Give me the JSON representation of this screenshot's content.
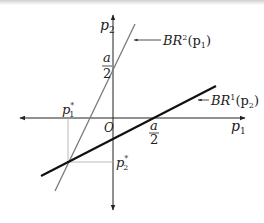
{
  "diagram": {
    "axes": {
      "x_label": "p",
      "x_sub": "1",
      "y_label": "p",
      "y_sub": "2",
      "origin_label": "O"
    },
    "ticks": {
      "x_intercept": {
        "num": "a",
        "den": "2"
      },
      "y_intercept": {
        "num": "a",
        "den": "2"
      }
    },
    "lines": [
      {
        "name": "BR2",
        "label_main": "BR",
        "label_sup": "2",
        "label_arg": "(p",
        "label_arg_sub": "1",
        "label_close": ")",
        "color": "#777777",
        "width": 1.3
      },
      {
        "name": "BR1",
        "label_main": "BR",
        "label_sup": "1",
        "label_arg": "(p",
        "label_arg_sub": "2",
        "label_close": ")",
        "color": "#111111",
        "width": 2.2
      }
    ],
    "equilibrium": {
      "p1_label": "p",
      "p1_sub": "1",
      "p1_sup": "*",
      "p2_label": "p",
      "p2_sub": "2",
      "p2_sup": "*"
    }
  }
}
